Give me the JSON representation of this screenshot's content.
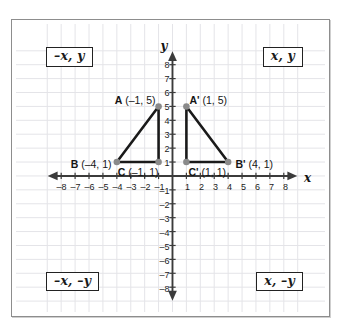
{
  "figure": {
    "background_color": "#ffffff",
    "frame_color": "#8d8d8d",
    "grid_color": "#e4e4e8",
    "axis_color": "#3b3b3b",
    "shape_color": "#1a1a1a",
    "vertex_color": "#8a8a8a"
  },
  "chart_data": {
    "type": "scatter",
    "title": "",
    "xlabel": "x",
    "ylabel": "y",
    "xlim": [
      -9,
      9
    ],
    "ylim": [
      -9,
      9
    ],
    "grid": true,
    "legend": "none",
    "x_ticks": [
      -8,
      -7,
      -6,
      -5,
      -4,
      -3,
      -2,
      -1,
      1,
      2,
      3,
      4,
      5,
      6,
      7,
      8
    ],
    "y_ticks": [
      8,
      7,
      6,
      5,
      4,
      3,
      2,
      1,
      -1,
      -2,
      -3,
      -4,
      -5,
      -6,
      -7,
      -8
    ],
    "x_tick_labels": [
      "–8",
      "–7",
      "–6",
      "–5",
      "–4",
      "–3",
      "–2",
      "–1",
      "1",
      "2",
      "3",
      "4",
      "5",
      "6",
      "7",
      "8"
    ],
    "y_tick_labels": [
      "8",
      "7",
      "6",
      "5",
      "4",
      "3",
      "2",
      "1",
      "–1",
      "–2",
      "–3",
      "–4",
      "–5",
      "–6",
      "–7",
      "–8"
    ],
    "series": [
      {
        "name": "Triangle ABC",
        "closed": true,
        "points": [
          {
            "label": "A",
            "x": -1,
            "y": 5
          },
          {
            "label": "B",
            "x": -4,
            "y": 1
          },
          {
            "label": "C",
            "x": -1,
            "y": 1
          }
        ]
      },
      {
        "name": "Triangle A'B'C'",
        "closed": true,
        "points": [
          {
            "label": "A'",
            "x": 1,
            "y": 5
          },
          {
            "label": "B'",
            "x": 4,
            "y": 1
          },
          {
            "label": "C'",
            "x": 1,
            "y": 1
          }
        ]
      }
    ],
    "annotations": [
      {
        "name": "label-A",
        "text_bold": "A",
        "text_rest": " (–1, 5)",
        "x": -1,
        "y": 5
      },
      {
        "name": "label-B",
        "text_bold": "B",
        "text_rest": " (–4, 1)",
        "x": -4,
        "y": 1
      },
      {
        "name": "label-C",
        "text_bold": "C",
        "text_rest": " (–1, 1)",
        "x": -1,
        "y": 1
      },
      {
        "name": "label-A-prime",
        "text_bold": "A'",
        "text_rest": " (1, 5)",
        "x": 1,
        "y": 5
      },
      {
        "name": "label-B-prime",
        "text_bold": "B'",
        "text_rest": " (4, 1)",
        "x": 4,
        "y": 1
      },
      {
        "name": "label-C-prime",
        "text_bold": "C'",
        "text_rest": " (1, 1)",
        "x": 1,
        "y": 1
      }
    ]
  },
  "labels": {
    "point_a": {
      "bold": "A",
      "rest": " (–1, 5)"
    },
    "point_a_prime": {
      "bold": "A'",
      "rest": " (1, 5)"
    },
    "point_b": {
      "bold": "B",
      "rest": " (–4, 1)"
    },
    "point_b_prime": {
      "bold": "B'",
      "rest": " (4, 1)"
    },
    "point_c": {
      "bold": "C",
      "rest": " (–1, 1)"
    },
    "point_c_prime": {
      "bold": "C'",
      "rest": " (1, 1)"
    },
    "x_axis_name": "x",
    "y_axis_name": "y"
  },
  "quadrants": {
    "q1": "x, y",
    "q2": "–x, y",
    "q3": "–x, –y",
    "q4": "x, –y"
  }
}
